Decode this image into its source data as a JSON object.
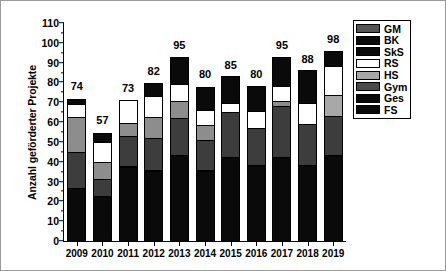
{
  "chart_data": {
    "type": "bar",
    "subtype": "stacked-bar",
    "title": "",
    "xlabel": "",
    "ylabel": "Anzahl geförderter Projekte",
    "ylim": [
      0,
      110
    ],
    "ytick_step": 10,
    "yminor_step": 5,
    "grid": false,
    "legend_position": "right",
    "categories": [
      "2009",
      "2010",
      "2011",
      "2012",
      "2013",
      "2014",
      "2015",
      "2016",
      "2017",
      "2018",
      "2019"
    ],
    "yticks": [
      "0",
      "10",
      "20",
      "30",
      "40",
      "50",
      "60",
      "70",
      "80",
      "90",
      "100",
      "110"
    ],
    "totals": [
      74,
      57,
      73,
      82,
      95,
      80,
      85,
      80,
      95,
      88,
      98
    ],
    "stack_order_bottom_to_top": [
      "FS",
      "Ges",
      "Gym",
      "HS",
      "RS",
      "SkS",
      "BK",
      "GM"
    ],
    "series": [
      {
        "name": "FS",
        "color": "#0a0a0a",
        "values": [
          27,
          23,
          38,
          36,
          44,
          36,
          43,
          39,
          43,
          39,
          44
        ]
      },
      {
        "name": "Ges",
        "color": "#3a3a3a",
        "values": [
          19,
          9,
          16,
          17,
          19,
          16,
          23,
          19,
          26,
          21,
          20
        ]
      },
      {
        "name": "Gym",
        "color": "#787878",
        "values": [
          18,
          9,
          7,
          11,
          9,
          8,
          0,
          0,
          3,
          0,
          0
        ]
      },
      {
        "name": "HS",
        "color": "#a8a8a8",
        "values": [
          0,
          0,
          0,
          0,
          0,
          0,
          0,
          0,
          0,
          0,
          11
        ]
      },
      {
        "name": "RS",
        "color": "#ffffff",
        "values": [
          7,
          11,
          12,
          11,
          9,
          8,
          5,
          9,
          8,
          11,
          15
        ]
      },
      {
        "name": "SkS",
        "color": "#0a0a0a",
        "values": [
          3,
          5,
          0,
          7,
          14,
          12,
          14,
          13,
          15,
          17,
          8
        ]
      },
      {
        "name": "BK",
        "color": "#0a0a0a",
        "values": [
          0,
          0,
          0,
          0,
          0,
          0,
          0,
          0,
          0,
          0,
          0
        ]
      },
      {
        "name": "GM",
        "color": "#555555",
        "values": [
          0,
          0,
          0,
          0,
          0,
          0,
          0,
          0,
          0,
          0,
          0
        ]
      }
    ],
    "stacks": [
      {
        "category": "2009",
        "total": 74,
        "segments": [
          {
            "label": "FS",
            "value": 27,
            "color": "#0a0a0a"
          },
          {
            "label": "Ges",
            "value": 19,
            "color": "#3d3d3d"
          },
          {
            "label": "Gym",
            "value": 18,
            "color": "#8d8d8d"
          },
          {
            "label": "RS",
            "value": 7,
            "color": "#ffffff"
          },
          {
            "label": "SkS",
            "value": 3,
            "color": "#0a0a0a"
          }
        ]
      },
      {
        "category": "2010",
        "total": 57,
        "segments": [
          {
            "label": "FS",
            "value": 23,
            "color": "#0a0a0a"
          },
          {
            "label": "Ges",
            "value": 9,
            "color": "#3d3d3d"
          },
          {
            "label": "Gym",
            "value": 9,
            "color": "#8d8d8d"
          },
          {
            "label": "RS",
            "value": 11,
            "color": "#ffffff"
          },
          {
            "label": "SkS",
            "value": 5,
            "color": "#0a0a0a"
          }
        ]
      },
      {
        "category": "2011",
        "total": 73,
        "segments": [
          {
            "label": "FS",
            "value": 38,
            "color": "#0a0a0a"
          },
          {
            "label": "Ges",
            "value": 16,
            "color": "#3d3d3d"
          },
          {
            "label": "Gym",
            "value": 7,
            "color": "#8d8d8d"
          },
          {
            "label": "RS",
            "value": 12,
            "color": "#ffffff"
          }
        ]
      },
      {
        "category": "2012",
        "total": 82,
        "segments": [
          {
            "label": "FS",
            "value": 36,
            "color": "#0a0a0a"
          },
          {
            "label": "Ges",
            "value": 17,
            "color": "#3d3d3d"
          },
          {
            "label": "Gym",
            "value": 11,
            "color": "#8d8d8d"
          },
          {
            "label": "RS",
            "value": 11,
            "color": "#ffffff"
          },
          {
            "label": "SkS",
            "value": 7,
            "color": "#0a0a0a"
          }
        ]
      },
      {
        "category": "2013",
        "total": 95,
        "segments": [
          {
            "label": "FS",
            "value": 44,
            "color": "#0a0a0a"
          },
          {
            "label": "Ges",
            "value": 19,
            "color": "#3d3d3d"
          },
          {
            "label": "Gym",
            "value": 9,
            "color": "#8d8d8d"
          },
          {
            "label": "RS",
            "value": 9,
            "color": "#ffffff"
          },
          {
            "label": "SkS",
            "value": 14,
            "color": "#0a0a0a"
          }
        ]
      },
      {
        "category": "2014",
        "total": 80,
        "segments": [
          {
            "label": "FS",
            "value": 36,
            "color": "#0a0a0a"
          },
          {
            "label": "Ges",
            "value": 16,
            "color": "#3d3d3d"
          },
          {
            "label": "Gym",
            "value": 8,
            "color": "#8d8d8d"
          },
          {
            "label": "RS",
            "value": 8,
            "color": "#ffffff"
          },
          {
            "label": "SkS",
            "value": 12,
            "color": "#0a0a0a"
          }
        ]
      },
      {
        "category": "2015",
        "total": 85,
        "segments": [
          {
            "label": "FS",
            "value": 43,
            "color": "#0a0a0a"
          },
          {
            "label": "Ges",
            "value": 23,
            "color": "#3d3d3d"
          },
          {
            "label": "RS",
            "value": 5,
            "color": "#ffffff"
          },
          {
            "label": "SkS",
            "value": 14,
            "color": "#0a0a0a"
          }
        ]
      },
      {
        "category": "2016",
        "total": 80,
        "segments": [
          {
            "label": "FS",
            "value": 39,
            "color": "#0a0a0a"
          },
          {
            "label": "Ges",
            "value": 19,
            "color": "#3d3d3d"
          },
          {
            "label": "RS",
            "value": 9,
            "color": "#ffffff"
          },
          {
            "label": "SkS",
            "value": 13,
            "color": "#0a0a0a"
          }
        ]
      },
      {
        "category": "2017",
        "total": 95,
        "segments": [
          {
            "label": "FS",
            "value": 43,
            "color": "#0a0a0a"
          },
          {
            "label": "Ges",
            "value": 26,
            "color": "#3d3d3d"
          },
          {
            "label": "Gym",
            "value": 3,
            "color": "#8d8d8d"
          },
          {
            "label": "RS",
            "value": 8,
            "color": "#ffffff"
          },
          {
            "label": "SkS",
            "value": 15,
            "color": "#0a0a0a"
          }
        ]
      },
      {
        "category": "2018",
        "total": 88,
        "segments": [
          {
            "label": "FS",
            "value": 39,
            "color": "#0a0a0a"
          },
          {
            "label": "Ges",
            "value": 21,
            "color": "#3d3d3d"
          },
          {
            "label": "RS",
            "value": 11,
            "color": "#ffffff"
          },
          {
            "label": "SkS",
            "value": 17,
            "color": "#0a0a0a"
          }
        ]
      },
      {
        "category": "2019",
        "total": 98,
        "segments": [
          {
            "label": "FS",
            "value": 44,
            "color": "#0a0a0a"
          },
          {
            "label": "Ges",
            "value": 20,
            "color": "#3d3d3d"
          },
          {
            "label": "HS",
            "value": 11,
            "color": "#a8a8a8"
          },
          {
            "label": "RS",
            "value": 15,
            "color": "#ffffff"
          },
          {
            "label": "SkS",
            "value": 8,
            "color": "#0a0a0a"
          }
        ]
      }
    ],
    "legend": [
      {
        "label": "GM",
        "color": "#555555"
      },
      {
        "label": "BK",
        "color": "#0a0a0a"
      },
      {
        "label": "SkS",
        "color": "#0a0a0a"
      },
      {
        "label": "RS",
        "color": "#ffffff"
      },
      {
        "label": "HS",
        "color": "#a8a8a8"
      },
      {
        "label": "Gym",
        "color": "#4a4a4a"
      },
      {
        "label": "Ges",
        "color": "#0a0a0a"
      },
      {
        "label": "FS",
        "color": "#0a0a0a"
      }
    ]
  }
}
